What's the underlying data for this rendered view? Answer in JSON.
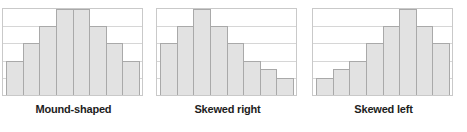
{
  "figure": {
    "width": 467,
    "height": 132,
    "background": "#ffffff",
    "panel_count": 3
  },
  "style": {
    "bar_fill": "#e2e2e2",
    "bar_stroke": "#a9a9a9",
    "gridline_color": "#d6d6d6",
    "border_color": "#c9c9c9",
    "label_color": "#1d1d1d"
  },
  "chart_data": [
    {
      "type": "bar",
      "title": "Mound-shaped",
      "xlabel": "",
      "ylabel": "",
      "grid": true,
      "legend": false,
      "ylim": [
        0,
        5
      ],
      "gridlines": 5,
      "categories": [
        "1",
        "2",
        "3",
        "4",
        "5",
        "6",
        "7",
        "8"
      ],
      "values": [
        2,
        3,
        4,
        5,
        5,
        4,
        3,
        2
      ]
    },
    {
      "type": "bar",
      "title": "Skewed right",
      "xlabel": "",
      "ylabel": "",
      "grid": true,
      "legend": false,
      "ylim": [
        0,
        5
      ],
      "gridlines": 5,
      "categories": [
        "1",
        "2",
        "3",
        "4",
        "5",
        "6",
        "7",
        "8"
      ],
      "values": [
        3,
        4,
        5,
        4,
        3,
        2,
        1.5,
        1
      ]
    },
    {
      "type": "bar",
      "title": "Skewed left",
      "xlabel": "",
      "ylabel": "",
      "grid": true,
      "legend": false,
      "ylim": [
        0,
        5
      ],
      "gridlines": 5,
      "categories": [
        "1",
        "2",
        "3",
        "4",
        "5",
        "6",
        "7",
        "8"
      ],
      "values": [
        1,
        1.5,
        2,
        3,
        4,
        5,
        4,
        3
      ]
    }
  ]
}
